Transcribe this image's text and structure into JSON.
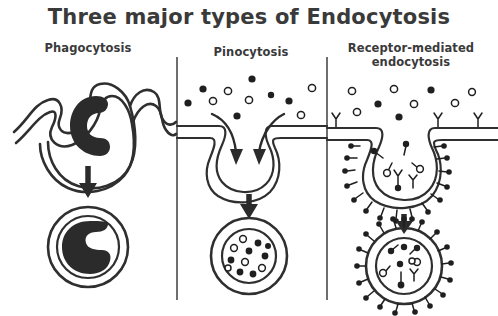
{
  "figure": {
    "title": "Three major types of Endocytosis",
    "background_color": "#ffffff",
    "ink_color": "#2f2f2f",
    "width": 498,
    "height": 316
  },
  "panels": [
    {
      "id": "phagocytosis",
      "label": "Phagocytosis",
      "label_lines": [
        "Phagocytosis"
      ],
      "membrane_style": "wavy-bilayer",
      "cargo": "large-solid-particle",
      "cargo_shape": "C-shaped bacterium",
      "cargo_count": 1,
      "vesicle_name": "phagosome",
      "vesicle_rings": 2,
      "vesicle_contents": "one large solid C-shaped particle",
      "arrow": "down-arrow"
    },
    {
      "id": "pinocytosis",
      "label": "Pinocytosis",
      "label_lines": [
        "Pinocytosis"
      ],
      "membrane_style": "flat-with-pit",
      "cargo": "extracellular-fluid-solutes",
      "solute_dots_filled": 7,
      "solute_dots_hollow": 7,
      "inflow_arrows": 2,
      "vesicle_name": "pinocytotic vesicle",
      "vesicle_rings": 2,
      "vesicle_contents": "many small filled and hollow solute dots",
      "vesicle_dot_count": 12,
      "arrow": "down-arrow"
    },
    {
      "id": "receptor-mediated-endocytosis",
      "label": "Receptor-mediated endocytosis",
      "label_lines": [
        "Receptor-mediated",
        "endocytosis"
      ],
      "membrane_style": "coated-pit",
      "cargo": "ligands-bound-to-receptors",
      "ligand_dots_filled": 5,
      "ligand_dots_hollow": 6,
      "receptors_on_flat_membrane": 3,
      "coat_name": "clathrin coat",
      "vesicle_name": "coated vesicle",
      "vesicle_rings": 2,
      "vesicle_contents": "receptors with bound ligands",
      "arrow": "down-arrow"
    }
  ],
  "legend_symbols": [
    {
      "name": "filled-dot",
      "meaning": "solute / ligand molecule (solid)"
    },
    {
      "name": "hollow-dot",
      "meaning": "solute / ligand molecule (open)"
    },
    {
      "name": "y-receptor",
      "meaning": "membrane receptor protein"
    },
    {
      "name": "clathrin-spike",
      "meaning": "clathrin coat protein"
    }
  ]
}
